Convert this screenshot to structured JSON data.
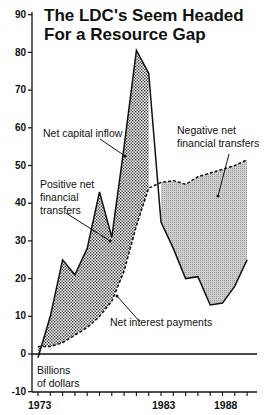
{
  "chart_data": {
    "type": "area",
    "title": "The LDC's Seem Headed For a Resource Gap",
    "title_lines": [
      "The LDC's Seem Headed",
      "For a Resource Gap"
    ],
    "xlabel": "",
    "ylabel": "Billions of dollars",
    "ylabel_lines": [
      "Billions",
      "of dollars"
    ],
    "x": [
      1973,
      1974,
      1975,
      1976,
      1977,
      1978,
      1979,
      1980,
      1981,
      1982,
      1983,
      1984,
      1985,
      1986,
      1987,
      1988,
      1989,
      1990
    ],
    "series": [
      {
        "name": "Net capital inflow",
        "style": "solid",
        "values": [
          -1,
          10,
          25,
          21,
          28,
          43,
          31,
          55,
          80.5,
          74.5,
          35,
          28,
          20,
          20.5,
          13,
          13.5,
          18,
          25
        ]
      },
      {
        "name": "Net interest payments",
        "style": "dashed",
        "values": [
          2,
          2,
          3,
          5,
          7,
          10,
          14,
          22,
          34,
          44,
          45.5,
          46,
          45,
          47,
          48,
          49,
          50,
          51.5
        ]
      }
    ],
    "annotations": [
      {
        "text": "Net capital inflow",
        "lines": [
          "Net capital inflow"
        ]
      },
      {
        "text": "Positive net financial transfers",
        "lines": [
          "Positive net",
          "financial",
          "transfers"
        ]
      },
      {
        "text": "Negative net financial transfers",
        "lines": [
          "Negative net",
          "financial transfers"
        ]
      },
      {
        "text": "Net interest payments",
        "lines": [
          "Net interest payments"
        ]
      }
    ],
    "yticks": [
      "90",
      "80",
      "70",
      "60",
      "50",
      "40",
      "30",
      "20",
      "10",
      "0",
      "-10"
    ],
    "xticks": [
      "1973",
      "1983",
      "1988"
    ],
    "ylim": [
      -10,
      90
    ],
    "xlim": [
      1973,
      1990
    ],
    "grid": false,
    "legend": "none"
  }
}
